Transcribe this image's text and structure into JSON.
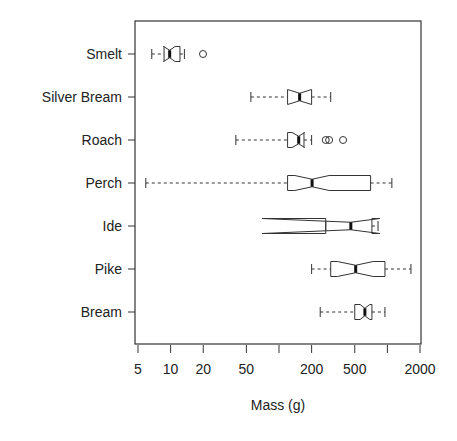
{
  "chart_data": {
    "type": "boxplot",
    "title": "",
    "xlabel": "Mass (g)",
    "ylabel": "",
    "x_scale": "log",
    "xlim": [
      5,
      2000
    ],
    "x_ticks": [
      5,
      10,
      20,
      50,
      100,
      200,
      500,
      1000,
      2000
    ],
    "x_tick_labels": [
      "5",
      "10",
      "20",
      "50",
      "",
      "200",
      "500",
      "",
      "2000"
    ],
    "notched": true,
    "categories": [
      "Smelt",
      "Silver Bream",
      "Roach",
      "Perch",
      "Ide",
      "Pike",
      "Bream"
    ],
    "boxes": [
      {
        "name": "Smelt",
        "whisker_low": 6.7,
        "q1": 8.7,
        "median": 9.8,
        "q3": 12.2,
        "whisker_high": 13.4,
        "notch_low": 8.6,
        "notch_high": 11.0,
        "outliers": [
          19.9
        ]
      },
      {
        "name": "Silver Bream",
        "whisker_low": 55,
        "q1": 120,
        "median": 155,
        "q3": 200,
        "whisker_high": 300,
        "notch_low": 120,
        "notch_high": 200,
        "outliers": []
      },
      {
        "name": "Roach",
        "whisker_low": 40,
        "q1": 120,
        "median": 152,
        "q3": 170,
        "whisker_high": 200,
        "notch_low": 132,
        "notch_high": 172,
        "outliers": [
          270,
          290,
          390
        ]
      },
      {
        "name": "Perch",
        "whisker_low": 5.9,
        "q1": 120,
        "median": 202,
        "q3": 700,
        "whisker_high": 1100,
        "notch_low": 140,
        "notch_high": 290,
        "outliers": []
      },
      {
        "name": "Ide",
        "whisker_low": 270,
        "q1": 270,
        "median": 460,
        "q3": 720,
        "whisker_high": 820,
        "notch_low": 70,
        "notch_high": 850,
        "outliers": []
      },
      {
        "name": "Pike",
        "whisker_low": 200,
        "q1": 300,
        "median": 510,
        "q3": 950,
        "whisker_high": 1650,
        "notch_low": 345,
        "notch_high": 740,
        "outliers": []
      },
      {
        "name": "Bream",
        "whisker_low": 240,
        "q1": 500,
        "median": 620,
        "q3": 720,
        "whisker_high": 950,
        "notch_low": 560,
        "notch_high": 690,
        "outliers": []
      }
    ],
    "grid": false,
    "legend": "none"
  }
}
